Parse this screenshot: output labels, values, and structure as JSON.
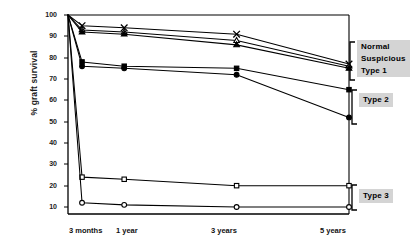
{
  "chart_data": {
    "type": "line",
    "title": "",
    "subtitle": "",
    "xlabel": "",
    "ylabel": "% graft survival",
    "categories": [
      "3 months",
      "1 year",
      "3 years",
      "5 years"
    ],
    "x_positions": [
      0.25,
      1,
      3,
      5
    ],
    "xlim": [
      0,
      5
    ],
    "ylim": [
      0,
      100
    ],
    "yticks": [
      10,
      20,
      30,
      40,
      50,
      60,
      70,
      80,
      90,
      100
    ],
    "ytick_labels": [
      "10",
      "20",
      "30",
      "40",
      "50",
      "60",
      "70",
      "80",
      "90",
      "100"
    ],
    "grid": false,
    "legend_position": "right",
    "origin_value": 100,
    "series": [
      {
        "name": "Normal",
        "group": "Normal / Suspicious / Type 1",
        "marker": "cross-x",
        "fill": "open",
        "values": [
          95,
          94,
          91,
          77
        ]
      },
      {
        "name": "Suspicious",
        "group": "Normal / Suspicious / Type 1",
        "marker": "triangle",
        "fill": "open",
        "values": [
          93,
          92,
          88,
          76
        ]
      },
      {
        "name": "Type 1",
        "group": "Normal / Suspicious / Type 1",
        "marker": "triangle",
        "fill": "filled",
        "values": [
          92,
          91,
          86,
          75
        ]
      },
      {
        "name": "Type 2 (a)",
        "group": "Type 2",
        "marker": "square",
        "fill": "filled",
        "values": [
          78,
          76,
          75,
          65
        ]
      },
      {
        "name": "Type 2 (b)",
        "group": "Type 2",
        "marker": "circle",
        "fill": "filled",
        "values": [
          76,
          75,
          72,
          52
        ]
      },
      {
        "name": "Type 3 (a)",
        "group": "Type 3",
        "marker": "square",
        "fill": "open",
        "values": [
          24,
          23,
          20,
          20
        ]
      },
      {
        "name": "Type 3 (b)",
        "group": "Type 3",
        "marker": "circle",
        "fill": "open",
        "values": [
          12,
          11,
          10,
          10
        ]
      }
    ],
    "legend_groups": [
      {
        "id": "group-1",
        "lines": [
          "Normal",
          "Suspicious",
          "Type 1"
        ]
      },
      {
        "id": "group-2",
        "lines": [
          "Type 2"
        ]
      },
      {
        "id": "group-3",
        "lines": [
          "Type 3"
        ]
      }
    ]
  },
  "axis": {
    "y_title": "% graft survival",
    "y_ticks": {
      "t100": "100",
      "t90": "90",
      "t80": "80",
      "t70": "70",
      "t60": "60",
      "t50": "50",
      "t40": "40",
      "t30": "30",
      "t20": "20",
      "t10": "10"
    },
    "x_ticks": {
      "x1": "3 months",
      "x2": "1 year",
      "x3": "3 years",
      "x4": "5 years"
    }
  },
  "legend": {
    "group1_line1": "Normal",
    "group1_line2": "Suspicious",
    "group1_line3": "Type 1",
    "group2_line1": "Type 2",
    "group3_line1": "Type 3"
  },
  "colors": {
    "ink": "#000000",
    "legend_background": "#d4d4d4",
    "page_background": "#ffffff"
  }
}
